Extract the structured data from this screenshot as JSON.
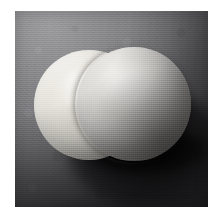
{
  "page": {
    "kind": "photograph",
    "width": 224,
    "height": 219,
    "page_background": "#ffffff"
  },
  "photo": {
    "caption": "",
    "left": 15,
    "top": 11,
    "width": 193,
    "height": 196,
    "lighting": "upper-left key light",
    "surface_color": "#77777a",
    "surface_highlight": "#9c9c9e",
    "surface_shadow_color": "#1e1e20",
    "vignette": "true",
    "grain": "visible film grain"
  },
  "subjects": [
    {
      "name": "left-sphere",
      "label": "Left sphere",
      "depth": "behind",
      "center_x": 74,
      "center_y": 94,
      "radius": 55,
      "base_color": "#e6e3dc",
      "highlight_color": "#f4f2ed",
      "shade_color": "#908d8a"
    },
    {
      "name": "right-sphere",
      "label": "Right sphere",
      "depth": "front",
      "center_x": 119,
      "center_y": 93,
      "radius": 57,
      "base_color": "#d8d7d3",
      "highlight_color": "#ecebe7",
      "shade_color": "#7c7a79"
    }
  ],
  "shadow": {
    "name": "cast-shadow",
    "label": "Cast shadow",
    "direction": "lower-right",
    "color": "#111113",
    "softness": "soft"
  }
}
